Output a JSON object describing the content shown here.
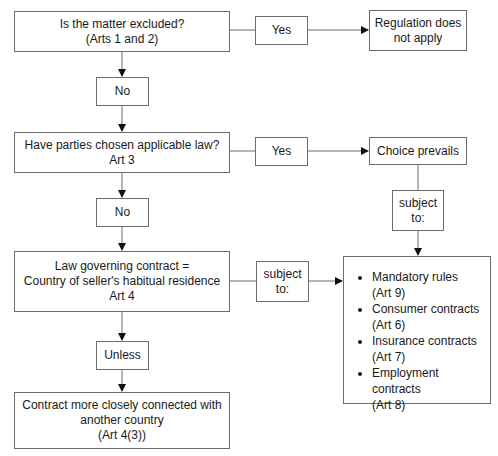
{
  "diagram": {
    "nodes": {
      "q_excluded": {
        "line1": "Is the matter excluded?",
        "line2": "(Arts 1 and 2)"
      },
      "yes_1": {
        "label": "Yes"
      },
      "not_apply": {
        "line1": "Regulation does",
        "line2": "not apply"
      },
      "no_1": {
        "label": "No"
      },
      "q_chosen": {
        "line1": "Have parties chosen applicable law?",
        "line2": "Art 3"
      },
      "yes_2": {
        "label": "Yes"
      },
      "choice_prevails": {
        "label": "Choice prevails"
      },
      "subject_to_right": {
        "line1": "subject",
        "line2": "to:"
      },
      "no_2": {
        "label": "No"
      },
      "law_governing": {
        "line1": "Law governing contract =",
        "line2": "Country of seller's habitual residence",
        "line3": "Art 4"
      },
      "subject_to_mid": {
        "line1": "subject",
        "line2": "to:"
      },
      "exceptions": {
        "items": [
          {
            "name": "Mandatory rules",
            "ref": "(Art 9)"
          },
          {
            "name": "Consumer contracts",
            "ref": "(Art 6)"
          },
          {
            "name": "Insurance contracts",
            "ref": "(Art 7)"
          },
          {
            "name": "Employment contracts",
            "ref": "(Art 8)"
          }
        ]
      },
      "unless": {
        "label": "Unless"
      },
      "closer_connection": {
        "line1": "Contract more closely connected with",
        "line2": "another country",
        "line3": "(Art 4(3))"
      }
    },
    "colors": {
      "stroke": "#6b6b6b",
      "arrow": "#111111",
      "text": "#1a1a1a",
      "background": "#ffffff"
    }
  }
}
